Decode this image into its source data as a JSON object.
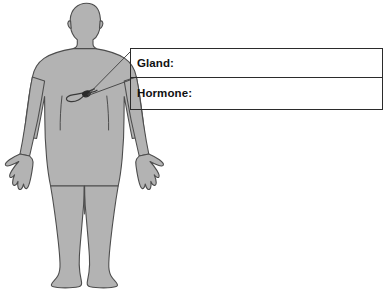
{
  "page": {
    "background_color": "#ffffff"
  },
  "figure": {
    "name": "human-body-silhouette",
    "fill_color": "#b3b3b3",
    "outline_color": "#4d4d4d",
    "organ": {
      "name": "pancreas",
      "outline_color": "#3a3a3a",
      "accent_color": "#2b2b2b"
    },
    "leader_lines": {
      "color": "#4a4a4a",
      "count": 2
    }
  },
  "answer_box": {
    "border_color": "#2b2b2b",
    "rows": [
      {
        "label": "Gland:",
        "value": "",
        "placeholder": ""
      },
      {
        "label": "Hormone:",
        "value": "",
        "placeholder": ""
      }
    ]
  }
}
